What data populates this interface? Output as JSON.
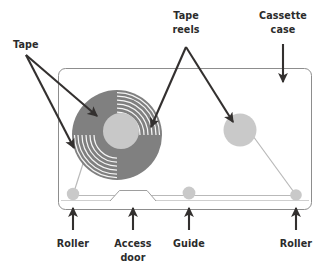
{
  "diagram": {
    "background_color": "#ffffff",
    "label_color": "#2b2b2b",
    "arrow_color": "#33302f",
    "case_outline_color": "#8d8d8d",
    "tape_path_color": "#b9b9b9",
    "reel_tape_color": "#808080",
    "hub_color": "#c8c8c8",
    "roller_color": "#c9c9c9",
    "labels": {
      "tape": "Tape",
      "tape_reels_line1": "Tape",
      "tape_reels_line2": "reels",
      "cassette_case_line1": "Cassette",
      "cassette_case_line2": "case",
      "roller_left": "Roller",
      "access_door_line1": "Access",
      "access_door_line2": "door",
      "guide": "Guide",
      "roller_right": "Roller"
    },
    "parts": [
      {
        "name": "Tape",
        "count": 2,
        "callout": "top-left"
      },
      {
        "name": "Tape reels",
        "count": 2,
        "callout": "top-center"
      },
      {
        "name": "Cassette case",
        "count": 1,
        "callout": "top-right"
      },
      {
        "name": "Roller",
        "count": 1,
        "callout": "bottom-left"
      },
      {
        "name": "Access door",
        "count": 1,
        "callout": "bottom-center-left"
      },
      {
        "name": "Guide",
        "count": 1,
        "callout": "bottom-center-right"
      },
      {
        "name": "Roller",
        "count": 1,
        "callout": "bottom-right"
      }
    ]
  }
}
